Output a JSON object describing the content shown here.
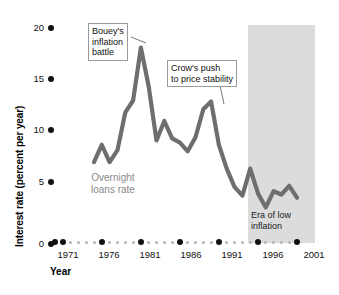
{
  "chart_data": {
    "type": "line",
    "title": "",
    "xlabel": "Year",
    "ylabel": "Interest rate (percent per year)",
    "xlim": [
      1970,
      2001
    ],
    "ylim": [
      0,
      20
    ],
    "grid": false,
    "legend_position": "inline-annotation",
    "y_ticks": [
      0,
      5,
      10,
      15,
      20
    ],
    "y_tick_labels": [
      "0",
      "5",
      "10",
      "15",
      "20"
    ],
    "x_ticks": [
      1971,
      1976,
      1981,
      1986,
      1991,
      1996,
      2001
    ],
    "x_tick_labels": [
      "1971",
      "1976",
      "1981",
      "1986",
      "1991",
      "1996",
      "2001"
    ],
    "series": [
      {
        "name": "Overnight loans rate",
        "color": "#6e6e6e",
        "x": [
          1975,
          1976,
          1977,
          1978,
          1979,
          1980,
          1981,
          1982,
          1983,
          1984,
          1985,
          1986,
          1987,
          1988,
          1989,
          1990,
          1991,
          1992,
          1993,
          1994,
          1995,
          1996,
          1997,
          1998,
          1999,
          2000,
          2001
        ],
        "values": [
          7.4,
          9.0,
          7.4,
          8.5,
          12.0,
          13.1,
          18.0,
          14.4,
          9.4,
          11.2,
          9.6,
          9.2,
          8.4,
          9.7,
          12.3,
          13.0,
          9.0,
          6.8,
          5.1,
          4.3,
          6.8,
          4.5,
          3.2,
          4.7,
          4.4,
          5.2,
          4.1
        ]
      }
    ],
    "shaded_region": {
      "label": "Era of low inflation",
      "x_start": 1993,
      "x_end": 2001,
      "color": "#dcdcdc"
    },
    "annotations": [
      {
        "text_lines": [
          "Bouey's",
          "inflation",
          "battle"
        ],
        "target_x": 1981,
        "target_y": 18.0
      },
      {
        "text_lines": [
          "Crow's push",
          "to price stability"
        ],
        "target_x": 1990,
        "target_y": 13.0
      }
    ]
  }
}
